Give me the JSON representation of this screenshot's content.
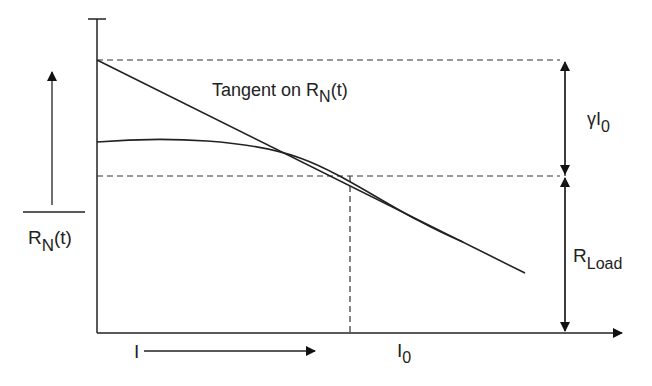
{
  "diagram": {
    "y_axis_label": {
      "main": "R",
      "sub": "N",
      "suffix": "(t)"
    },
    "tangent_label": {
      "prefix": "Tangent on R",
      "sub": "N",
      "suffix": "(t)"
    },
    "gamma_label": {
      "main": "γI",
      "sub": "0"
    },
    "rload_label": {
      "main": "R",
      "sub": "Load"
    },
    "x_axis_label": {
      "main": "I"
    },
    "i0_label": {
      "main": "I",
      "sub": "0"
    },
    "colors": {
      "line": "#222222",
      "dashed": "#333333"
    }
  }
}
